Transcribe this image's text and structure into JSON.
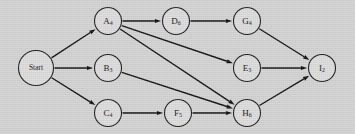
{
  "diagram": {
    "type": "activity-on-node-network",
    "background_color": "#d3d3d3",
    "node_fill_color": "#dcdcdc",
    "node_stroke_color": "#1a1a1a",
    "edge_color": "#0d0d0d",
    "nodes": [
      {
        "id": "start",
        "label": "Start",
        "main": "Start",
        "sub": "",
        "cx": 36,
        "cy": 68,
        "r": 17.5,
        "is_start": true
      },
      {
        "id": "a",
        "label": "A4",
        "main": "A",
        "sub": "4",
        "cx": 108,
        "cy": 21,
        "r": 13.5,
        "is_start": false
      },
      {
        "id": "b",
        "label": "B3",
        "main": "B",
        "sub": "3",
        "cx": 108,
        "cy": 68,
        "r": 13.5,
        "is_start": false
      },
      {
        "id": "c",
        "label": "C4",
        "main": "C",
        "sub": "4",
        "cx": 108,
        "cy": 113,
        "r": 13.5,
        "is_start": false
      },
      {
        "id": "d",
        "label": "D6",
        "main": "D",
        "sub": "6",
        "cx": 176,
        "cy": 21,
        "r": 13.5,
        "is_start": false
      },
      {
        "id": "e",
        "label": "E3",
        "main": "E",
        "sub": "3",
        "cx": 247,
        "cy": 68,
        "r": 13.5,
        "is_start": false
      },
      {
        "id": "f",
        "label": "F5",
        "main": "F",
        "sub": "5",
        "cx": 178,
        "cy": 113,
        "r": 13.5,
        "is_start": false
      },
      {
        "id": "g",
        "label": "G4",
        "main": "G",
        "sub": "4",
        "cx": 247,
        "cy": 21,
        "r": 13.5,
        "is_start": false
      },
      {
        "id": "h",
        "label": "H6",
        "main": "H",
        "sub": "6",
        "cx": 247,
        "cy": 113,
        "r": 13.5,
        "is_start": false
      },
      {
        "id": "i",
        "label": "I2",
        "main": "I",
        "sub": "2",
        "cx": 322,
        "cy": 68,
        "r": 13.5,
        "is_start": false
      }
    ],
    "edges": [
      {
        "from": "start",
        "to": "a"
      },
      {
        "from": "start",
        "to": "b"
      },
      {
        "from": "start",
        "to": "c"
      },
      {
        "from": "a",
        "to": "d"
      },
      {
        "from": "a",
        "to": "e"
      },
      {
        "from": "a",
        "to": "h"
      },
      {
        "from": "b",
        "to": "h"
      },
      {
        "from": "c",
        "to": "f"
      },
      {
        "from": "d",
        "to": "g"
      },
      {
        "from": "f",
        "to": "h"
      },
      {
        "from": "g",
        "to": "i"
      },
      {
        "from": "e",
        "to": "i"
      },
      {
        "from": "h",
        "to": "i"
      }
    ]
  }
}
